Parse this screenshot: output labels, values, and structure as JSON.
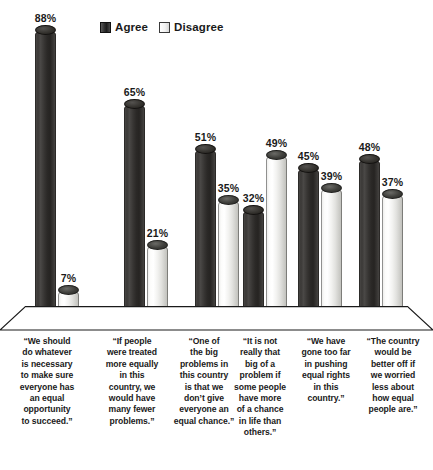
{
  "legend": {
    "items": [
      {
        "label": "Agree",
        "key": "agree",
        "color": "#332f2c"
      },
      {
        "label": "Disagree",
        "key": "disagree",
        "color": "#f0f0ee"
      }
    ]
  },
  "chart_data": {
    "type": "bar",
    "title": "",
    "subtitle": "",
    "xlabel": "",
    "ylabel": "",
    "ylim": [
      0,
      100
    ],
    "grid": false,
    "legend_position": "top-center",
    "value_suffix": "%",
    "style": "3d-cylinder",
    "categories": [
      "“We should do whatever is necessary to make sure everyone has an equal opportunity to succeed.”",
      "“If people were treated more equally in this country, we would have many fewer problems.”",
      "“One of the big problems in this country is that we don’t give everyone an equal chance.”",
      "“It is not really that big of a problem if some people have more of a chance in life than others.”",
      "“We have gone too far in pushing equal rights in this country.”",
      "“The country would be better off if we worried less about how equal people are.”"
    ],
    "series": [
      {
        "name": "Agree",
        "values": [
          88,
          65,
          51,
          32,
          45,
          48
        ]
      },
      {
        "name": "Disagree",
        "values": [
          7,
          21,
          35,
          49,
          39,
          37
        ]
      }
    ],
    "value_labels": {
      "agree": [
        "88%",
        "65%",
        "51%",
        "32%",
        "45%",
        "48%"
      ],
      "disagree": [
        "7%",
        "21%",
        "35%",
        "49%",
        "39%",
        "37%"
      ]
    }
  },
  "captions": [
    {
      "lines": [
        "“We should",
        "do whatever",
        "is necessary",
        "to make sure",
        "everyone has",
        "an equal",
        "opportunity",
        "to succeed.”"
      ]
    },
    {
      "lines": [
        "“If people",
        "were treated",
        "more equally",
        "in this",
        "country, we",
        "would have",
        "many fewer",
        "problems.”"
      ]
    },
    {
      "lines": [
        "“One of",
        "the big",
        "problems in",
        "this country",
        "is that we",
        "don’t give",
        "everyone an",
        "equal chance.”"
      ]
    },
    {
      "lines": [
        "“It is not",
        "really that",
        "big of a",
        "problem if",
        "some people",
        "have more",
        "of a chance",
        "in life than",
        "others.”"
      ]
    },
    {
      "lines": [
        "“We have",
        "gone too far",
        "in pushing",
        "equal rights",
        "in this",
        "country.”"
      ]
    },
    {
      "lines": [
        "“The country",
        "would be",
        "better off if",
        "we worried",
        "less about",
        "how equal",
        "people are.”"
      ]
    }
  ],
  "layout": {
    "baseline_y": 313,
    "max_bar_px": 283,
    "group_centers": [
      57,
      146,
      217,
      265,
      320,
      381
    ],
    "caption_lefts": [
      8,
      95,
      166,
      225,
      290,
      355
    ],
    "caption_widths": [
      78,
      74,
      76,
      70,
      72,
      76
    ]
  }
}
